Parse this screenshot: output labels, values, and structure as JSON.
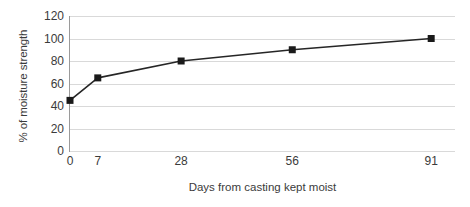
{
  "chart_data": {
    "type": "line",
    "title": "",
    "subtitle": "",
    "xlabel": "Days from casting kept moist",
    "ylabel": "% of moisture strength",
    "x": [
      0,
      7,
      28,
      56,
      91
    ],
    "categories": [
      "0",
      "7",
      "28",
      "56",
      "91"
    ],
    "values": [
      45,
      65,
      80,
      90,
      100
    ],
    "series": [
      {
        "name": "% of moisture strength",
        "values": [
          45,
          65,
          80,
          90,
          100
        ]
      }
    ],
    "xlim": [
      0,
      97
    ],
    "ylim": [
      0,
      120
    ],
    "ytick_values": [
      0,
      20,
      40,
      60,
      80,
      100,
      120
    ],
    "ytick_labels": [
      "0",
      "20",
      "40",
      "60",
      "80",
      "100",
      "120"
    ],
    "xtick_values": [
      0,
      7,
      28,
      56,
      91
    ],
    "xtick_labels": [
      "0",
      "7",
      "28",
      "56",
      "91"
    ],
    "grid": "horizontal",
    "legend": "none",
    "marker": "square",
    "colors": {
      "line": "#262626",
      "marker": "#1a1a1a",
      "gridline": "#d9d9d9",
      "axis": "#9a9a9a",
      "text": "#3b3b3b",
      "background": "#ffffff"
    }
  }
}
